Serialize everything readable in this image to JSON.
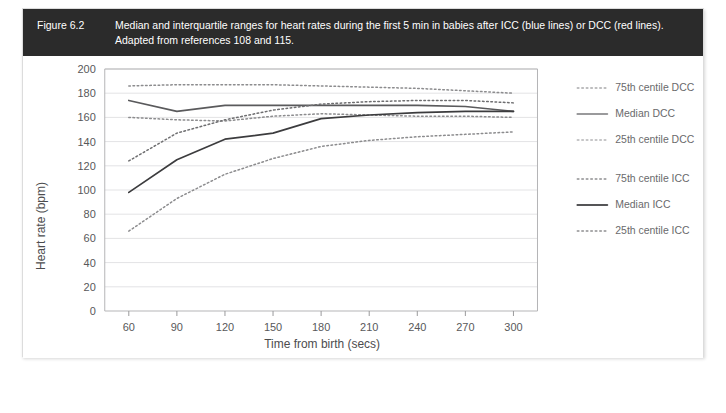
{
  "figure": {
    "number": "Figure 6.2",
    "caption_line1": "Median and interquartile ranges for heart rates during the first 5 min in babies after ICC (blue lines) or DCC (red lines).",
    "caption_line2": "Adapted from references 108 and 115.",
    "caption_bar_color": "#2b2b2b",
    "caption_text_color": "#ffffff"
  },
  "chart_data": {
    "type": "line",
    "title": "",
    "xlabel": "Time from birth (secs)",
    "ylabel": "Heart rate (bpm)",
    "xlim": [
      45,
      315
    ],
    "ylim": [
      0,
      200
    ],
    "xticks": [
      60,
      90,
      120,
      150,
      180,
      210,
      240,
      270,
      300
    ],
    "yticks": [
      0,
      20,
      40,
      60,
      80,
      100,
      120,
      140,
      160,
      180,
      200
    ],
    "grid": true,
    "legend_position": "right",
    "x": [
      60,
      90,
      120,
      150,
      180,
      210,
      240,
      270,
      300
    ],
    "series": [
      {
        "name": "75th centile DCC",
        "style": "dotted",
        "color": "#8c8c8e",
        "values": [
          186,
          187,
          187,
          187,
          186,
          185,
          184,
          182,
          180
        ]
      },
      {
        "name": "Median DCC",
        "style": "solid",
        "color": "#5a5a5c",
        "values": [
          174,
          165,
          170,
          170,
          170,
          170,
          170,
          169,
          165
        ]
      },
      {
        "name": "25th centile DCC",
        "style": "dotted",
        "color": "#8c8c8e",
        "values": [
          160,
          158,
          157,
          161,
          163,
          162,
          161,
          161,
          160
        ]
      },
      {
        "name": "75th centile ICC",
        "style": "dotted",
        "color": "#6e6e70",
        "values": [
          124,
          147,
          158,
          166,
          171,
          173,
          174,
          174,
          172
        ]
      },
      {
        "name": "Median ICC",
        "style": "solid",
        "color": "#3c3c3e",
        "values": [
          98,
          125,
          142,
          147,
          159,
          162,
          164,
          165,
          165
        ]
      },
      {
        "name": "25th centile ICC",
        "style": "dotted",
        "color": "#8c8c8e",
        "values": [
          66,
          93,
          113,
          126,
          136,
          141,
          144,
          146,
          148
        ]
      }
    ],
    "legend": [
      {
        "label": "75th centile DCC",
        "style": "dotted",
        "color": "#a8a8aa"
      },
      {
        "label": "Median DCC",
        "style": "solid",
        "color": "#9a9a9c"
      },
      {
        "label": "25th centile DCC",
        "style": "dotted",
        "color": "#b4b4b6"
      },
      {
        "label": "75th centile ICC",
        "style": "dotted",
        "color": "#8e8e90"
      },
      {
        "label": "Median ICC",
        "style": "solid",
        "color": "#55555 7"
      },
      {
        "label": "25th centile ICC",
        "style": "dotted",
        "color": "#8e8e90"
      }
    ]
  }
}
